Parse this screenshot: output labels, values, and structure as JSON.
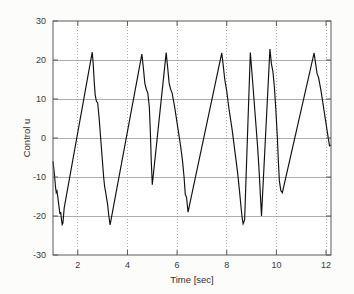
{
  "chart_data": {
    "type": "line",
    "title": "",
    "xlabel": "Time [sec]",
    "ylabel": "Control u",
    "xlim": [
      1.0,
      12.2
    ],
    "ylim": [
      -30,
      30
    ],
    "xticks": [
      2,
      4,
      6,
      8,
      10,
      12
    ],
    "xticklabels": [
      "2",
      "4",
      "6",
      "8",
      "10",
      "12"
    ],
    "yticks": [
      -30,
      -20,
      -10,
      0,
      10,
      20,
      30
    ],
    "yticklabels": [
      "-30",
      "-20",
      "-10",
      "0",
      "10",
      "20",
      "30"
    ],
    "grid": true,
    "grid_x_style": "dotted",
    "grid_y_style": "solid",
    "legend": null,
    "line_color": "#101010",
    "background_color": "#ffffff",
    "series": [
      {
        "name": "Control u",
        "x": [
          1.0,
          1.06,
          1.1,
          1.13,
          1.16,
          1.19,
          1.22,
          1.25,
          1.28,
          1.31,
          1.34,
          1.37,
          1.4,
          1.45,
          2.58,
          2.62,
          2.66,
          2.7,
          2.75,
          2.8,
          2.86,
          2.92,
          2.98,
          3.04,
          3.08,
          3.12,
          3.16,
          3.2,
          3.24,
          3.3,
          4.58,
          4.64,
          4.7,
          4.76,
          4.82,
          4.88,
          4.92,
          4.96,
          5.0,
          5.56,
          5.62,
          5.68,
          5.74,
          5.8,
          5.9,
          6.02,
          6.14,
          6.22,
          6.28,
          6.33,
          6.38,
          6.44,
          7.8,
          7.86,
          7.92,
          8.0,
          8.1,
          8.22,
          8.34,
          8.44,
          8.52,
          8.58,
          8.62,
          8.66,
          8.72,
          8.95,
          9.0,
          9.06,
          9.12,
          9.18,
          9.24,
          9.3,
          9.35,
          9.4,
          9.74,
          9.8,
          9.86,
          9.92,
          9.98,
          10.04,
          10.08,
          10.12,
          10.18,
          10.24,
          11.52,
          11.58,
          11.64,
          11.7,
          11.8,
          11.92,
          12.04,
          12.14,
          12.2
        ],
        "y": [
          -6.0,
          -9.5,
          -12.5,
          -14.0,
          -13.6,
          -15.0,
          -16.5,
          -18.0,
          -19.5,
          -19.0,
          -20.8,
          -22.2,
          -21.8,
          -18.0,
          22.0,
          19.0,
          14.5,
          11.0,
          9.4,
          9.0,
          5.0,
          0.0,
          -5.0,
          -10.0,
          -12.5,
          -13.8,
          -15.5,
          -17.0,
          -19.5,
          -22.3,
          21.5,
          18.0,
          14.0,
          12.5,
          11.5,
          8.0,
          2.0,
          -6.0,
          -12.0,
          21.9,
          18.0,
          14.0,
          12.5,
          11.5,
          8.0,
          3.0,
          -2.0,
          -6.0,
          -10.0,
          -14.5,
          -15.2,
          -19.0,
          21.8,
          18.5,
          15.0,
          12.0,
          7.0,
          2.0,
          -4.0,
          -9.0,
          -14.0,
          -18.0,
          -20.5,
          -22.0,
          -21.0,
          21.9,
          18.0,
          13.0,
          8.0,
          3.0,
          -2.0,
          -8.0,
          -14.0,
          -20.0,
          22.8,
          19.0,
          17.0,
          13.0,
          7.0,
          0.0,
          -6.0,
          -11.0,
          -13.5,
          -14.0,
          21.8,
          19.0,
          16.5,
          15.5,
          12.0,
          7.0,
          2.0,
          -2.0,
          -1.8
        ]
      }
    ]
  },
  "axes": {
    "plot_left_px": 53,
    "plot_right_px": 331,
    "plot_top_px": 21,
    "plot_bottom_px": 255
  }
}
